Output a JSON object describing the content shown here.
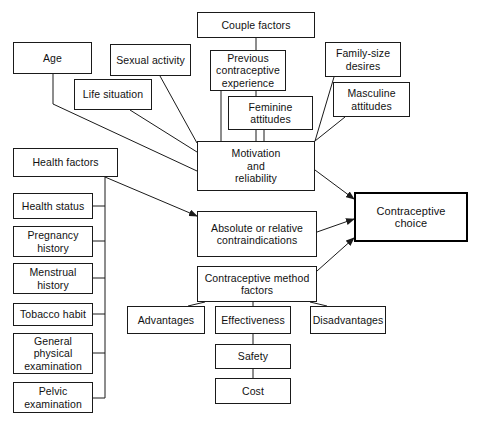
{
  "diagram": {
    "type": "flow-diagram",
    "canvas": {
      "width": 480,
      "height": 424
    },
    "style": {
      "background": "#ffffff",
      "line_color": "#1a1a1a",
      "text_color": "#111111",
      "emphasis_border_color": "#000000"
    },
    "nodes": [
      {
        "id": "couple_factors",
        "label": "Couple factors",
        "x": 197,
        "y": 12,
        "w": 118,
        "h": 26,
        "emphasis": false
      },
      {
        "id": "age",
        "label": "Age",
        "x": 13,
        "y": 42,
        "w": 79,
        "h": 32,
        "emphasis": false
      },
      {
        "id": "sexual_activity",
        "label": "Sexual activity",
        "x": 110,
        "y": 44,
        "w": 81,
        "h": 32,
        "emphasis": false
      },
      {
        "id": "previous_experience",
        "label": "Previous\ncontraceptive\nexperience",
        "x": 210,
        "y": 50,
        "w": 76,
        "h": 41,
        "emphasis": false
      },
      {
        "id": "family_size_desires",
        "label": "Family-size\ndesires",
        "x": 325,
        "y": 42,
        "w": 76,
        "h": 35,
        "emphasis": false
      },
      {
        "id": "life_situation",
        "label": "Life situation",
        "x": 74,
        "y": 79,
        "w": 78,
        "h": 31,
        "emphasis": false
      },
      {
        "id": "masculine_attitudes",
        "label": "Masculine\nattitudes",
        "x": 333,
        "y": 82,
        "w": 77,
        "h": 35,
        "emphasis": false
      },
      {
        "id": "feminine_attitudes",
        "label": "Feminine\nattitudes",
        "x": 228,
        "y": 96,
        "w": 85,
        "h": 34,
        "emphasis": false
      },
      {
        "id": "health_factors",
        "label": "Health factors",
        "x": 13,
        "y": 148,
        "w": 105,
        "h": 29,
        "emphasis": false
      },
      {
        "id": "motivation",
        "label": "Motivation\nand\nreliability",
        "x": 197,
        "y": 141,
        "w": 118,
        "h": 50,
        "emphasis": false
      },
      {
        "id": "health_status",
        "label": "Health status",
        "x": 13,
        "y": 193,
        "w": 80,
        "h": 26,
        "emphasis": false
      },
      {
        "id": "contraceptive_choice",
        "label": "Contraceptive choice",
        "x": 354,
        "y": 192,
        "w": 114,
        "h": 50,
        "emphasis": true
      },
      {
        "id": "contraindications",
        "label": "Absolute or relative\ncontraindications",
        "x": 197,
        "y": 211,
        "w": 120,
        "h": 46,
        "emphasis": false
      },
      {
        "id": "pregnancy_history",
        "label": "Pregnancy\nhistory",
        "x": 13,
        "y": 226,
        "w": 80,
        "h": 31,
        "emphasis": false
      },
      {
        "id": "menstrual_history",
        "label": "Menstrual\nhistory",
        "x": 13,
        "y": 263,
        "w": 80,
        "h": 31,
        "emphasis": false
      },
      {
        "id": "method_factors",
        "label": "Contraceptive method\nfactors",
        "x": 197,
        "y": 266,
        "w": 120,
        "h": 36,
        "emphasis": false
      },
      {
        "id": "tobacco_habit",
        "label": "Tobacco habit",
        "x": 13,
        "y": 303,
        "w": 80,
        "h": 23,
        "emphasis": false
      },
      {
        "id": "advantages",
        "label": "Advantages",
        "x": 127,
        "y": 306,
        "w": 78,
        "h": 28,
        "emphasis": false
      },
      {
        "id": "effectiveness",
        "label": "Effectiveness",
        "x": 215,
        "y": 306,
        "w": 76,
        "h": 28,
        "emphasis": false
      },
      {
        "id": "disadvantages",
        "label": "Disadvantages",
        "x": 310,
        "y": 306,
        "w": 76,
        "h": 28,
        "emphasis": false
      },
      {
        "id": "general_physical_exam",
        "label": "General\nphysical\nexamination",
        "x": 13,
        "y": 333,
        "w": 80,
        "h": 41,
        "emphasis": false
      },
      {
        "id": "safety",
        "label": "Safety",
        "x": 215,
        "y": 344,
        "w": 76,
        "h": 25,
        "emphasis": false
      },
      {
        "id": "cost",
        "label": "Cost",
        "x": 215,
        "y": 378,
        "w": 76,
        "h": 26,
        "emphasis": false
      },
      {
        "id": "pelvic_exam",
        "label": "Pelvic\nexamination",
        "x": 13,
        "y": 382,
        "w": 80,
        "h": 31,
        "emphasis": false
      }
    ],
    "edges": [
      {
        "id": "couple-to-motivation",
        "from": "couple_factors",
        "to": "motivation",
        "points": "256,38 256,141",
        "arrow": false
      },
      {
        "id": "prevexp-to-motivation",
        "from": "previous_experience",
        "to": "motivation",
        "points": "221,91 221,141",
        "arrow": false
      },
      {
        "id": "feminine-to-motivation",
        "from": "feminine_attitudes",
        "to": "motivation",
        "points": "264,130 264,141",
        "arrow": false
      },
      {
        "id": "familysize-to-motivation",
        "from": "family_size_desires",
        "to": "motivation",
        "points": "334,77 315,141",
        "arrow": false
      },
      {
        "id": "masculine-to-motivation",
        "from": "masculine_attitudes",
        "to": "motivation",
        "points": "345,117 315,141",
        "arrow": false
      },
      {
        "id": "sexual-to-motivation",
        "from": "sexual_activity",
        "to": "motivation",
        "points": "160,76 197,143",
        "arrow": false
      },
      {
        "id": "life-to-motivation",
        "from": "life_situation",
        "to": "motivation",
        "points": "130,110 197,152",
        "arrow": false
      },
      {
        "id": "age-to-motivation",
        "from": "age",
        "to": "motivation",
        "points": "53,74 53,104 197,171",
        "arrow": false
      },
      {
        "id": "health-to-contraindications",
        "from": "health_factors",
        "to": "contraindications",
        "points": "105,177 197,216",
        "arrow": true
      },
      {
        "id": "motivation-to-choice",
        "from": "motivation",
        "to": "contraceptive_choice",
        "points": "315,170 354,199",
        "arrow": true
      },
      {
        "id": "contra-to-choice",
        "from": "contraindications",
        "to": "contraceptive_choice",
        "points": "317,232 354,219",
        "arrow": true
      },
      {
        "id": "methodfactors-to-choice",
        "from": "method_factors",
        "to": "contraceptive_choice",
        "points": "317,271 354,238",
        "arrow": true
      },
      {
        "id": "healthfactors-spine",
        "from": "health_factors",
        "to": "pelvic_exam",
        "points": "105,177 105,398",
        "arrow": false
      },
      {
        "id": "healthstatus-spine",
        "from": "health_status",
        "to": "health_factors",
        "points": "93,206 105,206",
        "arrow": false
      },
      {
        "id": "pregnancy-spine",
        "from": "pregnancy_history",
        "to": "health_factors",
        "points": "93,241 105,241",
        "arrow": false
      },
      {
        "id": "menstrual-spine",
        "from": "menstrual_history",
        "to": "health_factors",
        "points": "93,278 105,278",
        "arrow": false
      },
      {
        "id": "tobacco-spine",
        "from": "tobacco_habit",
        "to": "health_factors",
        "points": "93,314 105,314",
        "arrow": false
      },
      {
        "id": "generalexam-spine",
        "from": "general_physical_exam",
        "to": "health_factors",
        "points": "93,353 105,353",
        "arrow": false
      },
      {
        "id": "pelvicexam-spine",
        "from": "pelvic_exam",
        "to": "health_factors",
        "points": "93,398 105,398",
        "arrow": false
      },
      {
        "id": "methodfactors-to-advantages",
        "from": "method_factors",
        "to": "advantages",
        "points": "205,302 188,306",
        "arrow": false
      },
      {
        "id": "methodfactors-to-effect",
        "from": "method_factors",
        "to": "effectiveness",
        "points": "253,302 253,306",
        "arrow": false
      },
      {
        "id": "methodfactors-to-disadv",
        "from": "method_factors",
        "to": "disadvantages",
        "points": "310,302 327,306",
        "arrow": false
      },
      {
        "id": "effectiveness-to-safety",
        "from": "effectiveness",
        "to": "safety",
        "points": "253,334 253,344",
        "arrow": false
      },
      {
        "id": "safety-to-cost",
        "from": "safety",
        "to": "cost",
        "points": "253,369 253,378",
        "arrow": false
      }
    ]
  }
}
